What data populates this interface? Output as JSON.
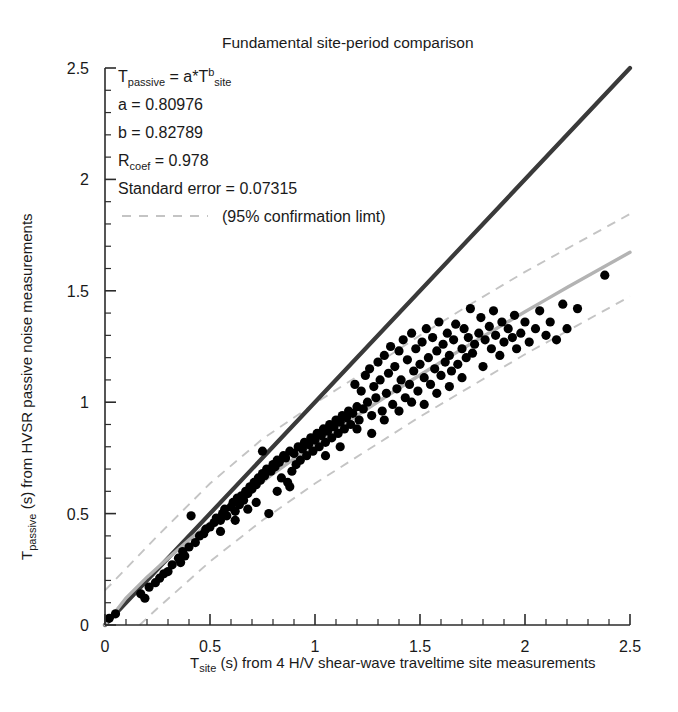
{
  "chart_data": {
    "type": "scatter",
    "title": "Fundamental site-period comparison",
    "xlabel_parts": {
      "sym": "T",
      "sub": "site",
      "rest": " (s) from 4 H/V shear-wave traveltime site measurements"
    },
    "ylabel_parts": {
      "sym": "T",
      "sub": "passive",
      "rest": " (s) from HVSR passive noise measurements"
    },
    "xlim": [
      0,
      2.5
    ],
    "ylim": [
      0,
      2.5
    ],
    "xticks": [
      0,
      0.5,
      1,
      1.5,
      2,
      2.5
    ],
    "yticks": [
      0,
      0.5,
      1,
      1.5,
      2,
      2.5
    ],
    "xticklabels": [
      "0",
      "0.5",
      "1",
      "1.5",
      "2",
      "2.5"
    ],
    "yticklabels": [
      "0",
      "0.5",
      "1",
      "1.5",
      "2",
      "2.5"
    ],
    "minor_tick_step": 0.1,
    "grid": false,
    "legend_position": "upper-left",
    "annotation": {
      "equation": {
        "lhs_sym": "T",
        "lhs_sub": "passive",
        "eq": " = a*",
        "rhs_sym": "T",
        "rhs_sup": "b",
        "rhs_sub": "site"
      },
      "a_label": "a = 0.80976",
      "b_label": "b = 0.82789",
      "rcoef_sym": "R",
      "rcoef_sub": "coef",
      "rcoef_value": " = 0.978",
      "stderr_label": "Standard error = 0.07315",
      "legend_label": "(95% confirmation limt)"
    },
    "fit": {
      "model": "power",
      "a": 0.80976,
      "b": 0.82789,
      "r_coef": 0.978,
      "standard_error": 0.07315
    },
    "series": [
      {
        "name": "Identity line (1:1)",
        "type": "line",
        "color": "#3a3a3a",
        "style": "solid",
        "points": [
          [
            0,
            0
          ],
          [
            2.5,
            2.5
          ]
        ]
      },
      {
        "name": "Power-law fit",
        "type": "line",
        "color": "#b3b3b3",
        "style": "solid",
        "points": [
          [
            0,
            0
          ],
          [
            0.1,
            0.1209
          ],
          [
            0.2,
            0.2149
          ],
          [
            0.3,
            0.2998
          ],
          [
            0.4,
            0.382
          ],
          [
            0.5,
            0.4583
          ],
          [
            0.6,
            0.5329
          ],
          [
            0.7,
            0.6049
          ],
          [
            0.8,
            0.6787
          ],
          [
            0.9,
            0.7462
          ],
          [
            1.0,
            0.8098
          ],
          [
            1.1,
            0.877
          ],
          [
            1.2,
            0.9401
          ],
          [
            1.3,
            1.0019
          ],
          [
            1.4,
            1.0625
          ],
          [
            1.5,
            1.1219
          ],
          [
            1.6,
            1.1804
          ],
          [
            1.7,
            1.238
          ],
          [
            1.8,
            1.2947
          ],
          [
            1.9,
            1.3507
          ],
          [
            2.0,
            1.4059
          ],
          [
            2.1,
            1.4605
          ],
          [
            2.2,
            1.5144
          ],
          [
            2.3,
            1.5678
          ],
          [
            2.4,
            1.6206
          ],
          [
            2.5,
            1.6729
          ]
        ]
      },
      {
        "name": "95% confirmation limit upper",
        "type": "line",
        "color": "#c4c4c4",
        "style": "dashed",
        "points": [
          [
            0,
            0.155
          ],
          [
            0.25,
            0.4
          ],
          [
            0.5,
            0.635
          ],
          [
            0.75,
            0.835
          ],
          [
            1.0,
            0.995
          ],
          [
            1.25,
            1.145
          ],
          [
            1.5,
            1.3
          ],
          [
            1.75,
            1.445
          ],
          [
            2.0,
            1.585
          ],
          [
            2.25,
            1.715
          ],
          [
            2.5,
            1.845
          ]
        ]
      },
      {
        "name": "95% confirmation limit lower",
        "type": "line",
        "color": "#c4c4c4",
        "style": "dashed",
        "points": [
          [
            0,
            -0.14
          ],
          [
            0.25,
            0.075
          ],
          [
            0.5,
            0.285
          ],
          [
            0.75,
            0.47
          ],
          [
            1.0,
            0.635
          ],
          [
            1.25,
            0.785
          ],
          [
            1.5,
            0.935
          ],
          [
            1.75,
            1.075
          ],
          [
            2.0,
            1.215
          ],
          [
            2.25,
            1.345
          ],
          [
            2.5,
            1.475
          ]
        ]
      }
    ],
    "scatter_points": [
      [
        0.02,
        0.03
      ],
      [
        0.05,
        0.05
      ],
      [
        0.17,
        0.14
      ],
      [
        0.19,
        0.12
      ],
      [
        0.21,
        0.17
      ],
      [
        0.26,
        0.21
      ],
      [
        0.28,
        0.23
      ],
      [
        0.32,
        0.27
      ],
      [
        0.35,
        0.3
      ],
      [
        0.37,
        0.33
      ],
      [
        0.38,
        0.31
      ],
      [
        0.4,
        0.35
      ],
      [
        0.41,
        0.49
      ],
      [
        0.43,
        0.37
      ],
      [
        0.45,
        0.4
      ],
      [
        0.47,
        0.41
      ],
      [
        0.48,
        0.43
      ],
      [
        0.5,
        0.44
      ],
      [
        0.52,
        0.46
      ],
      [
        0.53,
        0.48
      ],
      [
        0.55,
        0.47
      ],
      [
        0.56,
        0.5
      ],
      [
        0.57,
        0.52
      ],
      [
        0.58,
        0.49
      ],
      [
        0.6,
        0.53
      ],
      [
        0.61,
        0.55
      ],
      [
        0.62,
        0.51
      ],
      [
        0.63,
        0.57
      ],
      [
        0.64,
        0.54
      ],
      [
        0.65,
        0.58
      ],
      [
        0.66,
        0.56
      ],
      [
        0.67,
        0.6
      ],
      [
        0.68,
        0.59
      ],
      [
        0.69,
        0.62
      ],
      [
        0.7,
        0.61
      ],
      [
        0.71,
        0.64
      ],
      [
        0.72,
        0.63
      ],
      [
        0.73,
        0.66
      ],
      [
        0.74,
        0.65
      ],
      [
        0.75,
        0.68
      ],
      [
        0.76,
        0.67
      ],
      [
        0.77,
        0.7
      ],
      [
        0.78,
        0.5
      ],
      [
        0.79,
        0.69
      ],
      [
        0.8,
        0.72
      ],
      [
        0.81,
        0.71
      ],
      [
        0.82,
        0.74
      ],
      [
        0.83,
        0.73
      ],
      [
        0.84,
        0.66
      ],
      [
        0.85,
        0.76
      ],
      [
        0.86,
        0.75
      ],
      [
        0.87,
        0.64
      ],
      [
        0.88,
        0.78
      ],
      [
        0.89,
        0.69
      ],
      [
        0.9,
        0.77
      ],
      [
        0.91,
        0.72
      ],
      [
        0.92,
        0.8
      ],
      [
        0.93,
        0.74
      ],
      [
        0.94,
        0.79
      ],
      [
        0.95,
        0.82
      ],
      [
        0.96,
        0.76
      ],
      [
        0.97,
        0.81
      ],
      [
        0.98,
        0.84
      ],
      [
        0.99,
        0.78
      ],
      [
        1.0,
        0.83
      ],
      [
        1.01,
        0.86
      ],
      [
        1.02,
        0.8
      ],
      [
        1.03,
        0.85
      ],
      [
        1.04,
        0.88
      ],
      [
        1.05,
        0.82
      ],
      [
        1.06,
        0.87
      ],
      [
        1.07,
        0.9
      ],
      [
        1.08,
        0.84
      ],
      [
        1.09,
        0.89
      ],
      [
        1.1,
        0.92
      ],
      [
        1.11,
        0.86
      ],
      [
        1.12,
        0.91
      ],
      [
        1.13,
        0.94
      ],
      [
        1.14,
        0.88
      ],
      [
        1.15,
        0.93
      ],
      [
        1.16,
        0.96
      ],
      [
        1.17,
        0.9
      ],
      [
        1.18,
        0.95
      ],
      [
        1.19,
        1.08
      ],
      [
        1.2,
        0.98
      ],
      [
        1.21,
        0.92
      ],
      [
        1.22,
        1.05
      ],
      [
        1.23,
        0.97
      ],
      [
        1.24,
        1.12
      ],
      [
        1.25,
        1.0
      ],
      [
        1.26,
        1.15
      ],
      [
        1.27,
        0.94
      ],
      [
        1.28,
        1.07
      ],
      [
        1.29,
        1.02
      ],
      [
        1.3,
        1.18
      ],
      [
        1.31,
        1.1
      ],
      [
        1.32,
        0.96
      ],
      [
        1.33,
        1.21
      ],
      [
        1.34,
        1.04
      ],
      [
        1.35,
        1.13
      ],
      [
        1.36,
        1.25
      ],
      [
        1.37,
        0.99
      ],
      [
        1.38,
        1.16
      ],
      [
        1.39,
        1.06
      ],
      [
        1.4,
        1.23
      ],
      [
        1.41,
        1.1
      ],
      [
        1.42,
        1.28
      ],
      [
        1.43,
        1.02
      ],
      [
        1.44,
        1.19
      ],
      [
        1.45,
        1.08
      ],
      [
        1.46,
        1.31
      ],
      [
        1.47,
        1.14
      ],
      [
        1.48,
        1.24
      ],
      [
        1.49,
        1.05
      ],
      [
        1.5,
        1.17
      ],
      [
        1.51,
        1.27
      ],
      [
        1.52,
        1.11
      ],
      [
        1.53,
        1.33
      ],
      [
        1.54,
        1.2
      ],
      [
        1.55,
        1.08
      ],
      [
        1.56,
        1.29
      ],
      [
        1.57,
        1.15
      ],
      [
        1.58,
        1.23
      ],
      [
        1.59,
        1.36
      ],
      [
        1.6,
        1.12
      ],
      [
        1.61,
        1.26
      ],
      [
        1.62,
        1.18
      ],
      [
        1.63,
        1.31
      ],
      [
        1.64,
        1.21
      ],
      [
        1.65,
        1.14
      ],
      [
        1.66,
        1.28
      ],
      [
        1.67,
        1.35
      ],
      [
        1.68,
        1.17
      ],
      [
        1.7,
        1.24
      ],
      [
        1.71,
        1.33
      ],
      [
        1.72,
        1.2
      ],
      [
        1.73,
        1.29
      ],
      [
        1.74,
        1.42
      ],
      [
        1.75,
        1.22
      ],
      [
        1.76,
        1.26
      ],
      [
        1.78,
        1.31
      ],
      [
        1.79,
        1.38
      ],
      [
        1.8,
        1.16
      ],
      [
        1.81,
        1.28
      ],
      [
        1.83,
        1.34
      ],
      [
        1.84,
        1.24
      ],
      [
        1.85,
        1.41
      ],
      [
        1.86,
        1.3
      ],
      [
        1.88,
        1.21
      ],
      [
        1.89,
        1.36
      ],
      [
        1.9,
        1.27
      ],
      [
        1.92,
        1.33
      ],
      [
        1.94,
        1.29
      ],
      [
        1.95,
        1.39
      ],
      [
        1.96,
        1.24
      ],
      [
        1.98,
        1.31
      ],
      [
        2.0,
        1.36
      ],
      [
        2.02,
        1.27
      ],
      [
        2.05,
        1.33
      ],
      [
        2.07,
        1.41
      ],
      [
        2.1,
        1.3
      ],
      [
        2.12,
        1.36
      ],
      [
        2.15,
        1.28
      ],
      [
        2.18,
        1.44
      ],
      [
        2.2,
        1.33
      ],
      [
        2.25,
        1.42
      ],
      [
        2.38,
        1.57
      ],
      [
        0.75,
        0.78
      ],
      [
        0.82,
        0.6
      ],
      [
        0.88,
        0.62
      ],
      [
        1.05,
        0.76
      ],
      [
        1.12,
        0.8
      ],
      [
        1.2,
        0.88
      ],
      [
        1.27,
        0.86
      ],
      [
        1.33,
        0.92
      ],
      [
        1.4,
        0.96
      ],
      [
        1.46,
        1.0
      ],
      [
        1.52,
        0.99
      ],
      [
        1.58,
        1.04
      ],
      [
        1.64,
        1.07
      ],
      [
        1.7,
        1.11
      ],
      [
        0.55,
        0.42
      ],
      [
        0.62,
        0.47
      ],
      [
        0.68,
        0.52
      ],
      [
        0.72,
        0.55
      ],
      [
        0.3,
        0.24
      ],
      [
        0.24,
        0.19
      ],
      [
        0.36,
        0.28
      ]
    ]
  }
}
